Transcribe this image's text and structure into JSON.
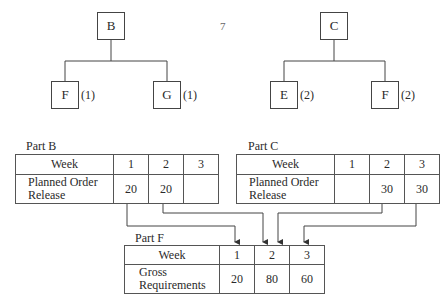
{
  "trees": [
    {
      "parent": "B",
      "children": [
        {
          "name": "F",
          "qty": "(1)"
        },
        {
          "name": "G",
          "qty": "(1)"
        }
      ]
    },
    {
      "parent": "C",
      "children": [
        {
          "name": "E",
          "qty": "(2)"
        },
        {
          "name": "F",
          "qty": "(2)"
        }
      ]
    }
  ],
  "stray_mark": "7",
  "tables": {
    "part_b": {
      "title": "Part B",
      "header_label": "Week",
      "weeks": [
        "1",
        "2",
        "3"
      ],
      "row_label_1": "Planned Order",
      "row_label_2": "Release",
      "values": [
        "20",
        "20",
        ""
      ]
    },
    "part_c": {
      "title": "Part C",
      "header_label": "Week",
      "weeks": [
        "1",
        "2",
        "3"
      ],
      "row_label_1": "Planned Order",
      "row_label_2": "Release",
      "values": [
        "",
        "30",
        "30"
      ]
    },
    "part_f": {
      "title": "Part F",
      "header_label": "Week",
      "weeks": [
        "1",
        "2",
        "3"
      ],
      "row_label_1": "Gross",
      "row_label_2": "Requirements",
      "values": [
        "20",
        "80",
        "60"
      ]
    }
  }
}
